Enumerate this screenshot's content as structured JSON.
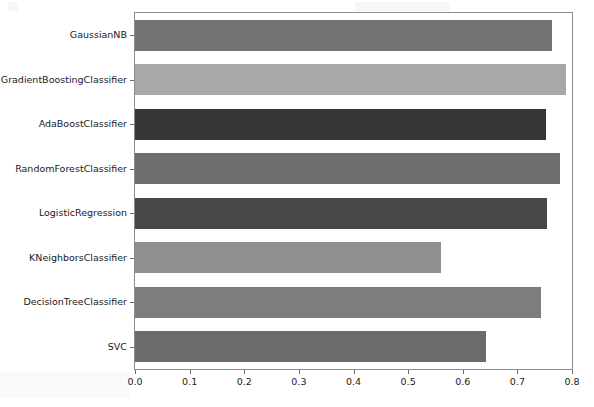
{
  "chart_data": {
    "type": "bar",
    "orientation": "horizontal",
    "title": "",
    "xlabel": "",
    "ylabel": "",
    "categories": [
      "GaussianNB",
      "GradientBoostingClassifier",
      "AdaBoostClassifier",
      "RandomForestClassifier",
      "LogisticRegression",
      "KNeighborsClassifier",
      "DecisionTreeClassifier",
      "SVC"
    ],
    "values": [
      0.763,
      0.789,
      0.752,
      0.778,
      0.754,
      0.56,
      0.743,
      0.642
    ],
    "bar_colors": [
      "#737373",
      "#a8a8a8",
      "#353535",
      "#6e6e6e",
      "#474747",
      "#8f8f8f",
      "#7d7d7d",
      "#6b6b6b"
    ],
    "xlim": [
      0.0,
      0.8
    ],
    "ylim": [
      -0.5,
      7.5
    ],
    "xticks": [
      0.0,
      0.1,
      0.2,
      0.3,
      0.4,
      0.5,
      0.6,
      0.7,
      0.8
    ],
    "xtick_labels": [
      "0.0",
      "0.1",
      "0.2",
      "0.3",
      "0.4",
      "0.5",
      "0.6",
      "0.7",
      "0.8"
    ],
    "grid": false,
    "legend": null,
    "annotations": []
  },
  "axes": {
    "spine_color": "#8c8c8c",
    "tick_color": "#6e6e6e",
    "label_color": "#1a1a1a"
  }
}
